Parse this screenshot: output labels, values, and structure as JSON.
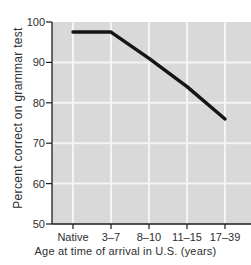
{
  "chart_data": {
    "type": "line",
    "categories": [
      "Native",
      "3–7",
      "8–10",
      "11–15",
      "17–39"
    ],
    "values": [
      97.5,
      97.5,
      91,
      84,
      76
    ],
    "title": "",
    "xlabel": "Age at time of arrival in U.S. (years)",
    "ylabel": "Percent correct on grammar test",
    "ylim": [
      50,
      100
    ],
    "yticks": [
      50,
      60,
      70,
      80,
      90,
      100
    ],
    "grid": true,
    "legend": "none",
    "colors": {
      "line": "#151515",
      "plot_bg": "#d9d9d9",
      "grid": "#f4f4f4",
      "axis": "#1c1c1c",
      "text": "#2e2e2e",
      "page_bg": "#ffffff"
    }
  }
}
